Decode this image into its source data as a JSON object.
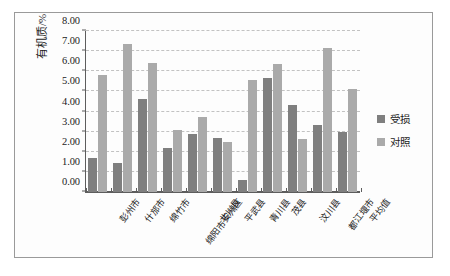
{
  "chart_data": {
    "type": "bar",
    "title": "",
    "xlabel": "",
    "ylabel": "有机质/%",
    "ylim": [
      0.0,
      8.0
    ],
    "ytick_step": 1.0,
    "ytick_labels": [
      "0.00",
      "1.00",
      "2.00",
      "3.00",
      "4.00",
      "5.00",
      "6.00",
      "7.00",
      "8.00"
    ],
    "grid": true,
    "legend_position": "right",
    "categories": [
      "彭州市",
      "什邡市",
      "绵竹市",
      "绵阳市安州区",
      "北川县",
      "平武县",
      "青川县",
      "茂县",
      "汶川县",
      "都江堰市",
      "平均值"
    ],
    "series": [
      {
        "name": "受损",
        "color": "#7f7f7f",
        "values": [
          1.7,
          1.42,
          4.6,
          2.15,
          2.85,
          2.68,
          0.6,
          5.62,
          4.3,
          3.3,
          2.98
        ]
      },
      {
        "name": "对照",
        "color": "#aaaaaa",
        "values": [
          5.78,
          7.3,
          6.38,
          3.08,
          3.72,
          2.48,
          5.55,
          6.3,
          2.62,
          7.12,
          5.08
        ]
      }
    ]
  }
}
